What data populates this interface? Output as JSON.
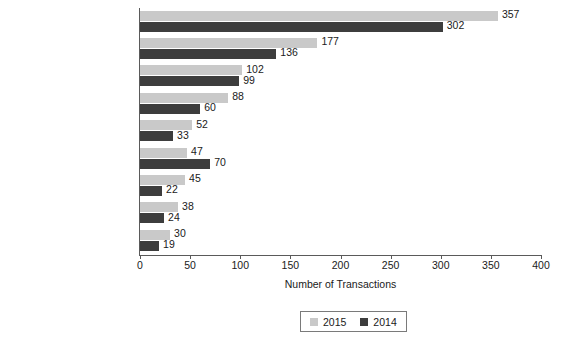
{
  "chart_data": {
    "type": "bar",
    "orientation": "horizontal",
    "title": "",
    "xlabel": "Number of Transactions",
    "ylabel": "",
    "xlim": [
      0,
      400
    ],
    "xticks": [
      0,
      50,
      100,
      150,
      200,
      250,
      300,
      350,
      400
    ],
    "grid": false,
    "legend_position": "bottom",
    "categories": [
      "Long-Term Care",
      "Other Services",
      "Hospital",
      "Physician Medical Groups",
      "Labs, MRI, & Dialysis",
      "Home Health & Hospice",
      "Managed Care",
      "Behavioral Health Care",
      "Rehabilitation"
    ],
    "series": [
      {
        "name": "2015",
        "color": "#c9c9c9",
        "values": [
          357,
          177,
          102,
          88,
          52,
          47,
          45,
          38,
          30
        ]
      },
      {
        "name": "2014",
        "color": "#3d3d3d",
        "values": [
          302,
          136,
          99,
          60,
          33,
          70,
          22,
          24,
          19
        ]
      }
    ]
  },
  "legend": {
    "entries": [
      {
        "label": "2015",
        "color": "#c9c9c9"
      },
      {
        "label": "2014",
        "color": "#3d3d3d"
      }
    ]
  }
}
